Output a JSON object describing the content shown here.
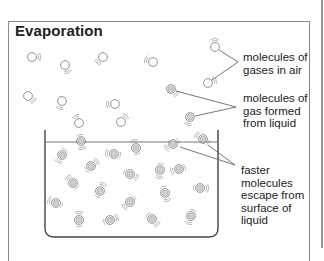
{
  "title": "Evaporation",
  "labels": {
    "gases_in_air": [
      "molecules of",
      "gases in air"
    ],
    "gas_from_liquid": [
      "molecules of",
      "gas formed",
      "from liquid"
    ],
    "faster_molecules": [
      "faster",
      "molecules",
      "escape from",
      "surface of",
      "liquid"
    ]
  },
  "colors": {
    "line": "#555555",
    "molecule_fill": "#cfcfcf",
    "molecule_stroke": "#777777",
    "frame": "#8a8a8a"
  },
  "molecules": {
    "air": [
      [
        32,
        57
      ],
      [
        65,
        65
      ],
      [
        103,
        57
      ],
      [
        153,
        62
      ],
      [
        215,
        47
      ],
      [
        208,
        83
      ],
      [
        28,
        96
      ],
      [
        62,
        101
      ],
      [
        115,
        104
      ],
      [
        79,
        123
      ],
      [
        121,
        122
      ]
    ],
    "gas_from_liquid": [
      [
        171,
        89
      ],
      [
        190,
        117
      ]
    ],
    "surface": [
      [
        81,
        141
      ],
      [
        173,
        144
      ],
      [
        203,
        139
      ]
    ],
    "liquid": [
      [
        62,
        155
      ],
      [
        114,
        154
      ],
      [
        136,
        148
      ],
      [
        91,
        166
      ],
      [
        130,
        174
      ],
      [
        160,
        170
      ],
      [
        179,
        169
      ],
      [
        73,
        183
      ],
      [
        100,
        191
      ],
      [
        200,
        188
      ],
      [
        165,
        193
      ],
      [
        130,
        202
      ],
      [
        56,
        203
      ],
      [
        79,
        220
      ],
      [
        110,
        220
      ],
      [
        152,
        219
      ],
      [
        191,
        216
      ]
    ]
  }
}
